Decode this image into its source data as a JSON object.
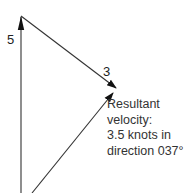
{
  "diagram": {
    "vectors": [
      {
        "name": "north-component",
        "label": "5",
        "from": [
          21,
          193
        ],
        "to": [
          21,
          16
        ]
      },
      {
        "name": "east-component",
        "label": "3",
        "from": [
          21,
          16
        ],
        "to": [
          117,
          89
        ]
      },
      {
        "name": "resultant",
        "label": "",
        "from": [
          32,
          193
        ],
        "to": [
          114,
          92
        ]
      }
    ],
    "labels": {
      "north": "5",
      "east": "3"
    },
    "caption": {
      "line1": "Resultant",
      "line2": "velocity:",
      "line3": "3.5 knots in",
      "line4": "direction 037°"
    },
    "colors": {
      "line": "#333333",
      "text": "#333333",
      "background": "#ffffff"
    }
  }
}
